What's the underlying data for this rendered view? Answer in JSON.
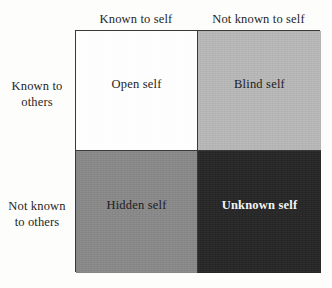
{
  "figure": {
    "name": "Johari Window",
    "type": "2x2-matrix"
  },
  "columns": [
    {
      "id": "known-to-self",
      "label": "Known to self"
    },
    {
      "id": "not-known-to-self",
      "label": "Not known to self"
    }
  ],
  "rows": [
    {
      "id": "known-to-others",
      "line1": "Known to",
      "line2": "others"
    },
    {
      "id": "not-known-to-others",
      "line1": "Not known",
      "line2": "to others"
    }
  ],
  "quadrants": [
    {
      "id": "open-self",
      "label": "Open self",
      "row": "known-to-others",
      "column": "known-to-self",
      "fill": "#ffffff",
      "text_color": "#1c1c1c",
      "bold": false
    },
    {
      "id": "blind-self",
      "label": "Blind self",
      "row": "known-to-others",
      "column": "not-known-to-self",
      "fill": "#b8b8b8",
      "text_color": "#1c1c1c",
      "bold": false
    },
    {
      "id": "hidden-self",
      "label": "Hidden self",
      "row": "not-known-to-others",
      "column": "known-to-self",
      "fill": "#898989",
      "text_color": "#1c1c1c",
      "bold": false
    },
    {
      "id": "unknown-self",
      "label": "Unknown self",
      "row": "not-known-to-others",
      "column": "not-known-to-self",
      "fill": "#262626",
      "text_color": "#f4f4f4",
      "bold": true
    }
  ],
  "colors": {
    "page_background": "#fdfdfc",
    "border": "#3a3a3a",
    "text": "#1f1f1f"
  }
}
